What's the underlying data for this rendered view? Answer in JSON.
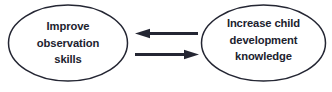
{
  "diagram": {
    "type": "two-node-bidirectional-cycle",
    "background_color": "#ffffff",
    "stroke_color": "#242633",
    "text_color": "#20222e",
    "nodes": [
      {
        "id": "improve-observation-skills",
        "shape": "ellipse",
        "lines": [
          "Improve",
          "observation",
          "skills"
        ],
        "text": "Improve observation skills"
      },
      {
        "id": "increase-child-development-knowledge",
        "shape": "ellipse",
        "lines": [
          "Increase child",
          "development",
          "knowledge"
        ],
        "text": "Increase child development knowledge"
      }
    ],
    "connectors": [
      {
        "id": "arrow-right-to-left",
        "direction": "left",
        "from": "increase-child-development-knowledge",
        "to": "improve-observation-skills"
      },
      {
        "id": "arrow-left-to-right",
        "direction": "right",
        "from": "improve-observation-skills",
        "to": "increase-child-development-knowledge"
      }
    ]
  }
}
